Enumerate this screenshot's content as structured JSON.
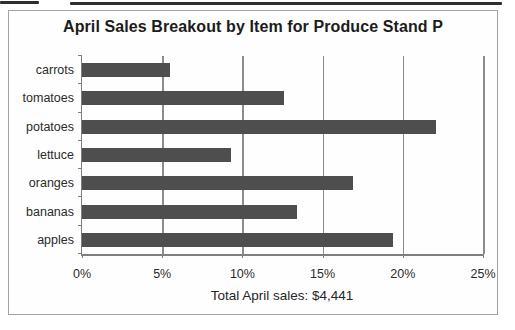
{
  "page": {
    "title": "April Sales Breakout by Item for Produce Stand P",
    "footer": "Total April sales: $4,441"
  },
  "chart_data": {
    "type": "bar",
    "orientation": "horizontal",
    "title": "April Sales Breakout by Item for Produce Stand P",
    "categories": [
      "carrots",
      "tomatoes",
      "potatoes",
      "lettuce",
      "oranges",
      "bananas",
      "apples"
    ],
    "values": [
      5.5,
      12.6,
      22.1,
      9.3,
      16.9,
      13.4,
      19.4
    ],
    "value_unit": "percent of total sales",
    "xlabel": "",
    "ylabel": "",
    "xlim": [
      0,
      25
    ],
    "x_ticks": [
      0,
      5,
      10,
      15,
      20,
      25
    ],
    "x_tick_labels": [
      "0%",
      "5%",
      "10%",
      "15%",
      "20%",
      "25%"
    ],
    "grid": true,
    "legend": false,
    "bar_color": "#4e4e4e",
    "gridline_color": "#8c8c8c",
    "annotation": "Total April sales: $4,441",
    "total_april_sales": "$4,441"
  }
}
